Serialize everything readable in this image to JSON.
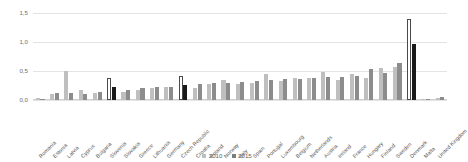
{
  "chart_data": {
    "type": "bar",
    "title": "",
    "xlabel": "",
    "ylabel": "",
    "ylim": [
      0,
      1.5
    ],
    "ytick_labels": [
      "0,0",
      "0,5",
      "1,0",
      "1,5"
    ],
    "ytick_values": [
      0,
      0.5,
      1.0,
      1.5
    ],
    "grid": true,
    "legend_position": "bottom-center",
    "decimal_separator": ",",
    "categories": [
      "Romania",
      "Estonia",
      "Latvia",
      "Cyprus",
      "Bulgaria",
      "Slovenia",
      "Slovakia",
      "Greece",
      "Lithuania",
      "Germany",
      "Czech Republic",
      "Croatia",
      "Poland",
      "Norway",
      "Italy",
      "Spain",
      "Portugal",
      "Luxembourg",
      "Belgium",
      "Netherlands",
      "Austria",
      "Ireland",
      "France",
      "Hungary",
      "Finland",
      "Sweden",
      "Denmark",
      "Malta",
      "United Kingdom"
    ],
    "series": [
      {
        "name": "2010",
        "color": "#bfbfbf",
        "values": [
          0.03,
          0.1,
          0.5,
          0.17,
          0.12,
          0.38,
          0.13,
          0.17,
          0.2,
          0.23,
          0.41,
          0.2,
          0.28,
          0.34,
          0.27,
          0.3,
          0.44,
          0.32,
          0.38,
          0.38,
          0.48,
          0.35,
          0.44,
          0.38,
          0.55,
          0.57,
          1.4,
          0.02,
          0.04
        ]
      },
      {
        "name": "2015",
        "color": "#8c8c8c",
        "values": [
          0.02,
          0.12,
          0.12,
          0.1,
          0.14,
          0.22,
          0.17,
          0.2,
          0.23,
          0.23,
          0.26,
          0.27,
          0.29,
          0.3,
          0.31,
          0.33,
          0.35,
          0.36,
          0.37,
          0.38,
          0.39,
          0.4,
          0.41,
          0.53,
          0.47,
          0.63,
          0.96,
          0.02,
          0.05
        ]
      }
    ],
    "highlighted_categories": [
      "Slovenia",
      "Czech Republic",
      "Denmark"
    ]
  },
  "legend": {
    "items": [
      {
        "label": "2010"
      },
      {
        "label": "2015"
      }
    ]
  }
}
